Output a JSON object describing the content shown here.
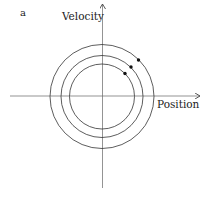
{
  "panel_label": "a",
  "axes": {
    "y_label": "Velocity",
    "x_label": "Position"
  },
  "colors": {
    "stroke": "#333333",
    "axis": "#555555",
    "dot": "#111111",
    "background": "#ffffff"
  },
  "diagram": {
    "type": "phase-portrait",
    "center": [
      102,
      96.5
    ],
    "circles": [
      {
        "name": "outer",
        "radius": 52
      },
      {
        "name": "middle",
        "radius": 41
      },
      {
        "name": "inner",
        "radius": 32.5
      }
    ],
    "points": [
      {
        "circle": "outer",
        "x": 138.5,
        "y": 60
      },
      {
        "circle": "middle",
        "x": 131,
        "y": 67
      },
      {
        "circle": "inner",
        "x": 125,
        "y": 73.5
      }
    ]
  }
}
